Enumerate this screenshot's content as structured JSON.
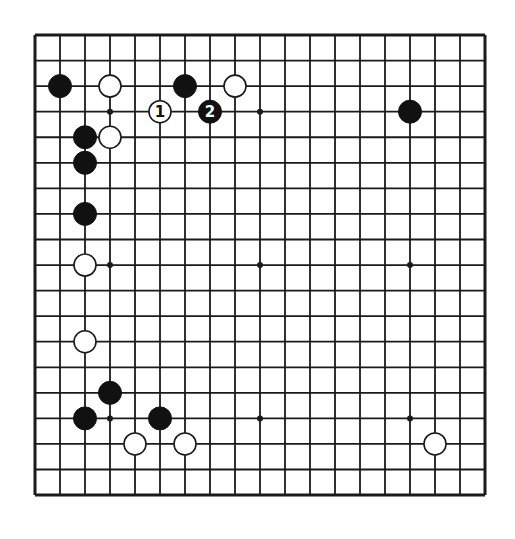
{
  "board": {
    "size": 19,
    "origin": {
      "x": 35,
      "y": 35
    },
    "spacing": {
      "x": 25,
      "y": 25.56
    },
    "line_color": "#1a1a1a",
    "background": "#ffffff",
    "star_points": [
      [
        3,
        3
      ],
      [
        9,
        3
      ],
      [
        15,
        3
      ],
      [
        3,
        9
      ],
      [
        9,
        9
      ],
      [
        15,
        9
      ],
      [
        3,
        15
      ],
      [
        9,
        15
      ],
      [
        15,
        15
      ]
    ]
  },
  "stones": [
    {
      "color": "black",
      "col": 1,
      "row": 2,
      "label": ""
    },
    {
      "color": "white",
      "col": 3,
      "row": 2,
      "label": ""
    },
    {
      "color": "black",
      "col": 6,
      "row": 2,
      "label": ""
    },
    {
      "color": "white",
      "col": 8,
      "row": 2,
      "label": ""
    },
    {
      "color": "white",
      "col": 5,
      "row": 3,
      "label": "1"
    },
    {
      "color": "black",
      "col": 7,
      "row": 3,
      "label": "2"
    },
    {
      "color": "black",
      "col": 15,
      "row": 3,
      "label": ""
    },
    {
      "color": "black",
      "col": 2,
      "row": 4,
      "label": ""
    },
    {
      "color": "white",
      "col": 3,
      "row": 4,
      "label": ""
    },
    {
      "color": "black",
      "col": 2,
      "row": 5,
      "label": ""
    },
    {
      "color": "black",
      "col": 2,
      "row": 7,
      "label": ""
    },
    {
      "color": "white",
      "col": 2,
      "row": 9,
      "label": ""
    },
    {
      "color": "white",
      "col": 2,
      "row": 12,
      "label": ""
    },
    {
      "color": "black",
      "col": 3,
      "row": 14,
      "label": ""
    },
    {
      "color": "black",
      "col": 2,
      "row": 15,
      "label": ""
    },
    {
      "color": "black",
      "col": 5,
      "row": 15,
      "label": ""
    },
    {
      "color": "white",
      "col": 4,
      "row": 16,
      "label": ""
    },
    {
      "color": "white",
      "col": 6,
      "row": 16,
      "label": ""
    },
    {
      "color": "white",
      "col": 16,
      "row": 16,
      "label": ""
    }
  ]
}
